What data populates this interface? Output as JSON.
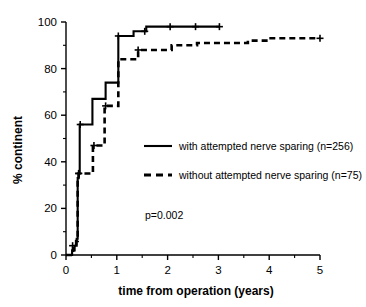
{
  "chart_data": {
    "type": "line",
    "title": "",
    "subtitle": "",
    "xlabel": "time from operation (years)",
    "ylabel": "% continent",
    "xlim": [
      0,
      5
    ],
    "ylim": [
      0,
      100
    ],
    "xticks": [
      0,
      1,
      2,
      3,
      4,
      5
    ],
    "xtick_labels": [
      "0",
      "1",
      "2",
      "3",
      "4",
      "5"
    ],
    "xminor_ticks": [
      0.5,
      1.5,
      2.5,
      3.5,
      4.5
    ],
    "yticks": [
      0,
      20,
      40,
      60,
      80,
      100
    ],
    "ytick_labels": [
      "0",
      "20",
      "40",
      "60",
      "80",
      "100"
    ],
    "yminor_ticks": [
      10,
      30,
      50,
      70,
      90
    ],
    "grid": false,
    "legend_position": "center-right",
    "annotations": [
      {
        "text": "p=0.002",
        "x": 1.55,
        "y": 17
      }
    ],
    "series": [
      {
        "name": "with attempted nerve sparing (n=256)",
        "style": "solid",
        "color": "#000000",
        "step": "post",
        "points": [
          [
            0.0,
            0
          ],
          [
            0.08,
            0
          ],
          [
            0.12,
            2
          ],
          [
            0.17,
            4
          ],
          [
            0.21,
            7
          ],
          [
            0.23,
            33
          ],
          [
            0.25,
            35
          ],
          [
            0.27,
            56
          ],
          [
            0.5,
            56
          ],
          [
            0.52,
            67
          ],
          [
            0.75,
            67
          ],
          [
            0.78,
            74
          ],
          [
            1.0,
            74
          ],
          [
            1.03,
            94
          ],
          [
            1.3,
            94
          ],
          [
            1.33,
            96
          ],
          [
            1.55,
            96
          ],
          [
            1.58,
            98
          ],
          [
            3.02,
            98
          ]
        ],
        "censor_points": [
          [
            0.13,
            4
          ],
          [
            0.25,
            35
          ],
          [
            0.28,
            56
          ],
          [
            1.03,
            94
          ],
          [
            1.55,
            96
          ],
          [
            2.05,
            98
          ],
          [
            2.55,
            98
          ],
          [
            3.02,
            98
          ]
        ]
      },
      {
        "name": "without attempted nerve sparing (n=75)",
        "style": "dashed",
        "color": "#000000",
        "step": "post",
        "points": [
          [
            0.0,
            0
          ],
          [
            0.1,
            0
          ],
          [
            0.14,
            3
          ],
          [
            0.2,
            6
          ],
          [
            0.23,
            33
          ],
          [
            0.25,
            35
          ],
          [
            0.5,
            35
          ],
          [
            0.53,
            47
          ],
          [
            0.73,
            47
          ],
          [
            0.76,
            64
          ],
          [
            1.0,
            64
          ],
          [
            1.03,
            84
          ],
          [
            1.38,
            84
          ],
          [
            1.42,
            88
          ],
          [
            2.05,
            88
          ],
          [
            2.08,
            90
          ],
          [
            2.55,
            90
          ],
          [
            2.58,
            91
          ],
          [
            3.55,
            91
          ],
          [
            3.58,
            92
          ],
          [
            3.95,
            92
          ],
          [
            3.99,
            93
          ],
          [
            5.0,
            93
          ]
        ],
        "censor_points": [
          [
            0.25,
            35
          ],
          [
            0.55,
            47
          ],
          [
            0.78,
            64
          ],
          [
            1.42,
            88
          ],
          [
            5.0,
            93
          ]
        ]
      }
    ]
  },
  "axes": {
    "y_axis_title": "% continent",
    "x_axis_title": "time from operation (years)"
  },
  "legend": {
    "entries": [
      {
        "label": "with attempted nerve sparing (n=256)",
        "style": "solid"
      },
      {
        "label": "without attempted nerve sparing (n=75)",
        "style": "dashed"
      }
    ]
  },
  "annotation": {
    "p_value": "p=0.002"
  },
  "colors": {
    "background": "#ffffff",
    "foreground": "#000000"
  }
}
